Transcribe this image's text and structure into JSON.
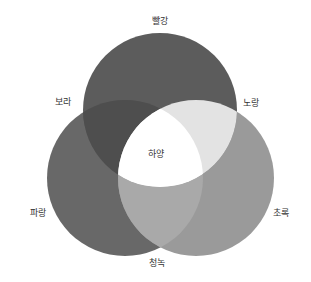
{
  "diagram": {
    "type": "venn-3",
    "title": "",
    "circles": [
      {
        "id": "red",
        "label": "빨강",
        "cx": 160,
        "cy": 110,
        "r": 77
      },
      {
        "id": "blue",
        "label": "파랑",
        "cx": 125,
        "cy": 178,
        "r": 78
      },
      {
        "id": "green",
        "label": "초록",
        "cx": 196,
        "cy": 178,
        "r": 78
      }
    ],
    "regions": {
      "red_only": {
        "fill": "#5c5c5c"
      },
      "blue_only": {
        "fill": "#686868"
      },
      "green_only": {
        "fill": "#9a9a9a"
      },
      "red_blue": {
        "label": "보라",
        "fill": "#4e4e4e"
      },
      "red_green": {
        "label": "노랑",
        "fill": "#e3e3e3"
      },
      "blue_green": {
        "label": "청녹",
        "fill": "#a9a9a9"
      },
      "all": {
        "label": "하양",
        "fill": "#ffffff"
      }
    },
    "labels": {
      "red": "빨강",
      "purple": "보라",
      "yellow": "노랑",
      "white": "하양",
      "blue": "파랑",
      "green": "초록",
      "cyan": "청녹"
    }
  }
}
